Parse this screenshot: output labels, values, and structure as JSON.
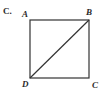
{
  "option_label": "C.",
  "figure": {
    "type": "square-with-diagonal",
    "vertices": {
      "A": {
        "label": "A",
        "x": 30,
        "y": 20
      },
      "B": {
        "label": "B",
        "x": 89,
        "y": 20
      },
      "C": {
        "label": "C",
        "x": 89,
        "y": 78
      },
      "D": {
        "label": "D",
        "x": 30,
        "y": 78
      }
    },
    "edges": [
      "AB",
      "BC",
      "CD",
      "DA"
    ],
    "diagonal": "DB",
    "stroke_color": "#333333"
  }
}
